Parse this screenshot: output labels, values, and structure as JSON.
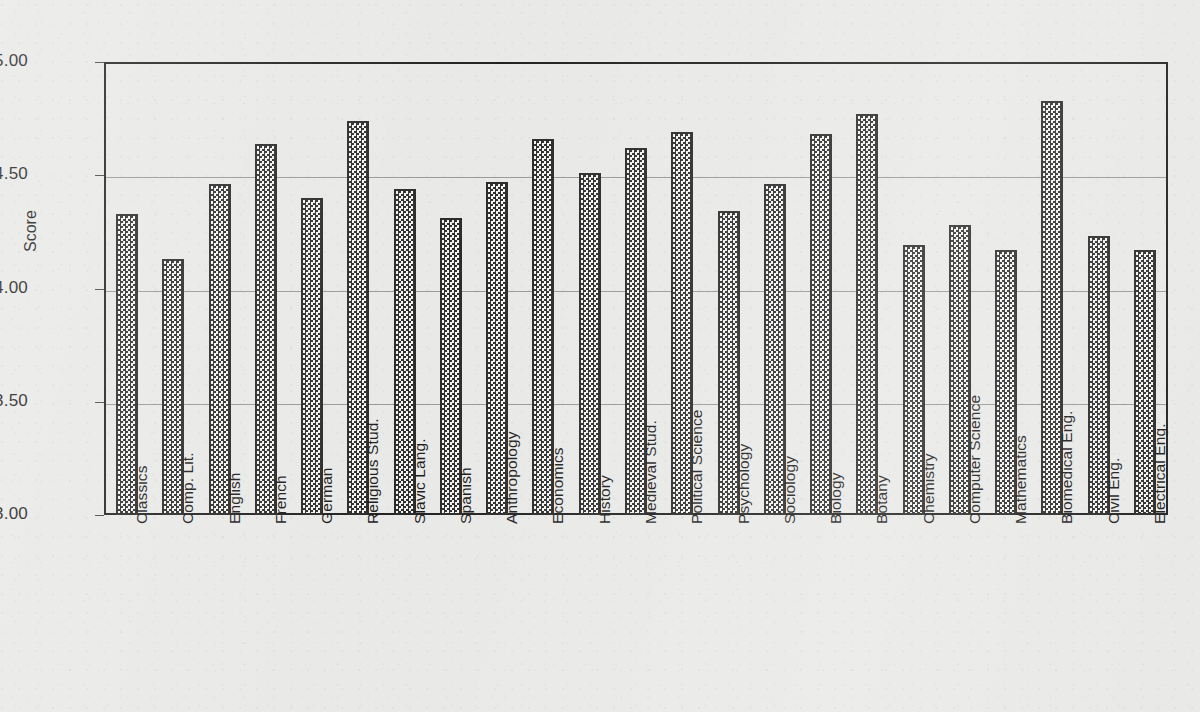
{
  "chart_data": {
    "type": "bar",
    "title": "",
    "subtitle": "",
    "xlabel": "",
    "ylabel": "Score",
    "ylim": [
      3.0,
      5.0
    ],
    "ytick_labels": [
      "5.00",
      "4.50",
      "4.00",
      "3.50",
      "3.00"
    ],
    "ytick_values": [
      5.0,
      4.5,
      4.0,
      3.5,
      3.0
    ],
    "grid": "horizontal",
    "legend": "none",
    "bar_fill": "checkerboard-hatch",
    "bar_edge_color": "#2b2b2b",
    "categories": [
      "Classics",
      "Comp. Lit.",
      "English",
      "French",
      "German",
      "Religious Stud.",
      "Slavic Lang.",
      "Spanish",
      "Anthropology",
      "Economics",
      "History",
      "Medieval Stud.",
      "Political  Science",
      "Psychology",
      "Sociology",
      "Biology",
      "Botany",
      "Chemistry",
      "Computer Science",
      "Mathematics",
      "Biomedical Eng.",
      "Civil Eng.",
      "Electrical Eng."
    ],
    "values": [
      4.33,
      4.13,
      4.46,
      4.64,
      4.4,
      4.74,
      4.44,
      4.31,
      4.47,
      4.66,
      4.51,
      4.62,
      4.69,
      4.34,
      4.46,
      4.68,
      4.77,
      4.19,
      4.28,
      4.17,
      4.83,
      4.23,
      4.17
    ]
  },
  "colors": {
    "background": "#e9e9e7",
    "axis": "#232323",
    "grid": "#9a9a97",
    "text": "#1d1d1d"
  }
}
